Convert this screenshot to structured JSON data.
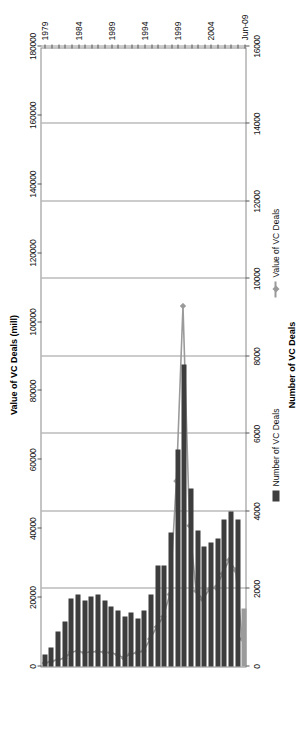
{
  "chart_data": {
    "type": "bar",
    "title": "",
    "orientation": "horizontal-rotated",
    "categories": [
      "1979",
      "1980",
      "1981",
      "1982",
      "1983",
      "1984",
      "1985",
      "1986",
      "1987",
      "1988",
      "1989",
      "1990",
      "1991",
      "1992",
      "1993",
      "1994",
      "1995",
      "1996",
      "1997",
      "1998",
      "1999",
      "2000",
      "2001",
      "2002",
      "2003",
      "2004",
      "2005",
      "2006",
      "2007",
      "2008",
      "Jun-09"
    ],
    "series": [
      {
        "name": "Number of VC Deals",
        "type": "bar",
        "axis": "bottom",
        "color": "#3d3d3d",
        "values": [
          300,
          500,
          900,
          1150,
          1750,
          1850,
          1700,
          1800,
          1850,
          1700,
          1550,
          1450,
          1300,
          1400,
          1250,
          1450,
          1850,
          2600,
          2600,
          3450,
          5600,
          7800,
          4600,
          3500,
          3100,
          3200,
          3300,
          3800,
          4000,
          3800,
          1500
        ]
      },
      {
        "name": "Value of VC Deals",
        "type": "line",
        "axis": "top",
        "color": "#9a9a9a",
        "values": [
          1000,
          1500,
          2000,
          2400,
          4200,
          4500,
          4000,
          4200,
          4400,
          4200,
          4000,
          3500,
          2500,
          3600,
          4000,
          4500,
          8000,
          11500,
          14500,
          21000,
          54000,
          105000,
          41000,
          22000,
          19500,
          22500,
          23000,
          27000,
          31000,
          28000,
          8000
        ]
      }
    ],
    "top_axis": {
      "title": "Value of VC Deals (mill)",
      "ticks": [
        "0",
        "20000",
        "40000",
        "60000",
        "80000",
        "100000",
        "120000",
        "140000",
        "160000",
        "180000"
      ],
      "min": 0,
      "max": 180000
    },
    "bottom_axis": {
      "title": "Number of VC Deals",
      "ticks": [
        "0",
        "2000",
        "4000",
        "6000",
        "8000",
        "10000",
        "12000",
        "14000",
        "16000"
      ],
      "min": 0,
      "max": 16000
    },
    "category_axis": {
      "visible_labels": [
        "1979",
        "1984",
        "1989",
        "1994",
        "1999",
        "2004",
        "Jun-09"
      ]
    },
    "legend": {
      "position": "right",
      "entries": [
        {
          "label": "Value of VC Deals",
          "marker": "line"
        },
        {
          "label": "Number of VC Deals",
          "marker": "bar"
        }
      ]
    },
    "grid": true
  }
}
